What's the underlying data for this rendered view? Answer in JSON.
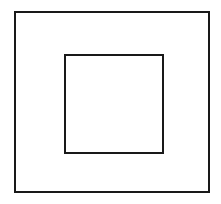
{
  "figure": {
    "title": "Nested squares line drawing",
    "background_color": "#ffffff",
    "canvas": {
      "width": 221,
      "height": 204
    },
    "shapes": [
      {
        "name": "outer-square",
        "label": "Outer square",
        "kind": "square",
        "x": 14,
        "y": 11,
        "width": 196,
        "height": 182,
        "stroke_color": "#191919",
        "stroke_width": 2,
        "fill": "none"
      },
      {
        "name": "inner-square",
        "label": "Inner square",
        "kind": "square",
        "x": 64,
        "y": 54,
        "width": 100,
        "height": 100,
        "stroke_color": "#191919",
        "stroke_width": 2,
        "fill": "none"
      }
    ]
  },
  "chart_data": {
    "type": "diagram",
    "title": "Nested squares line drawing",
    "shape_count": 2,
    "items": [
      {
        "id": "outer-square",
        "shape": "square",
        "x": 14,
        "y": 11,
        "width": 196,
        "height": 182,
        "stroke": "#191919",
        "stroke_width": 2,
        "fill": "none"
      },
      {
        "id": "inner-square",
        "shape": "square",
        "x": 64,
        "y": 54,
        "width": 100,
        "height": 100,
        "stroke": "#191919",
        "stroke_width": 2,
        "fill": "none"
      }
    ]
  }
}
